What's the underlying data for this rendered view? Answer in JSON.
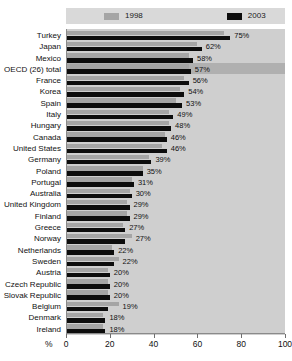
{
  "chart_data": {
    "type": "bar",
    "title": "",
    "xlabel": "%",
    "ylabel": "",
    "xlim": [
      0,
      100
    ],
    "xticks": [
      0,
      20,
      40,
      60,
      80,
      100
    ],
    "grid": true,
    "orientation": "horizontal",
    "legend_position": "top",
    "value_suffix": "%",
    "highlight_category": "OECD (26) total",
    "categories": [
      "Turkey",
      "Japan",
      "Mexico",
      "OECD (26) total",
      "France",
      "Korea",
      "Spain",
      "Italy",
      "Hungary",
      "Canada",
      "United States",
      "Germany",
      "Poland",
      "Portugal",
      "Australia",
      "United Kingdom",
      "Finland",
      "Greece",
      "Norway",
      "Netherlands",
      "Sweden",
      "Austria",
      "Czech Republic",
      "Slovak Republic",
      "Belgium",
      "Denmark",
      "Ireland"
    ],
    "series": [
      {
        "name": "1998",
        "color": "#a5a5a5",
        "values": [
          72,
          60,
          56,
          56,
          54,
          52,
          50,
          47,
          47,
          45,
          44,
          38,
          35,
          30,
          29,
          28,
          28,
          26,
          30,
          21,
          24,
          19,
          19,
          19,
          24,
          17,
          17
        ]
      },
      {
        "name": "2003",
        "color": "#0d0d0d",
        "values": [
          75,
          62,
          58,
          57,
          56,
          54,
          53,
          49,
          48,
          46,
          46,
          39,
          35,
          31,
          30,
          29,
          29,
          27,
          27,
          22,
          22,
          20,
          20,
          20,
          19,
          18,
          18
        ]
      }
    ],
    "value_labels": [
      "75%",
      "62%",
      "58%",
      "57%",
      "56%",
      "54%",
      "53%",
      "49%",
      "48%",
      "46%",
      "46%",
      "39%",
      "35%",
      "31%",
      "30%",
      "29%",
      "29%",
      "27%",
      "27%",
      "22%",
      "22%",
      "20%",
      "20%",
      "20%",
      "19%",
      "18%",
      "18%"
    ]
  },
  "legend": {
    "items": [
      {
        "label": "1998",
        "swatch": "legend-swatch-1998"
      },
      {
        "label": "2003",
        "swatch": "legend-swatch-2003"
      }
    ]
  },
  "axis": {
    "unit_label": "%",
    "tick_labels": [
      "0",
      "20",
      "40",
      "60",
      "80",
      "100"
    ]
  }
}
